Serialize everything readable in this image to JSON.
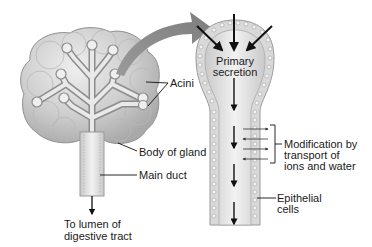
{
  "figure": {
    "labels": {
      "acini": "Acini",
      "body_of_gland": "Body of gland",
      "main_duct": "Main duct",
      "to_lumen_line1": "To lumen of",
      "to_lumen_line2": "digestive tract",
      "primary_line1": "Primary",
      "primary_line2": "secretion",
      "modification_line1": "Modification by",
      "modification_line2": "transport of",
      "modification_line3": "ions and water",
      "epithelial_line1": "Epithelial",
      "epithelial_line2": "cells"
    },
    "colors": {
      "gland_fill": "#cfcfcf",
      "gland_shade": "#b5b5b5",
      "duct_fill": "#e4e4e4",
      "cell_fill": "#d8d8d8",
      "arrow_gray": "#8a8a8a",
      "ink": "#1a1a1a"
    }
  }
}
